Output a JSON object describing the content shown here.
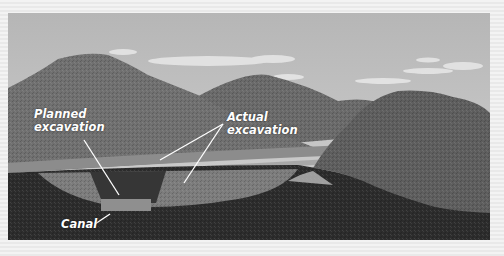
{
  "figure": {
    "type": "illustrated cross-section of mountain landscape with excavation",
    "labels": {
      "planned": [
        "Planned",
        "excavation"
      ],
      "actual": [
        "Actual",
        "excavation"
      ],
      "canal": "Canal"
    }
  },
  "colors": {
    "frame_light": "#f3f3f3",
    "frame_dark": "#e9e9e9",
    "sky_top": "#b9b9b9",
    "sky_bottom": "#d0d0d0",
    "mountain": "#6d6d6d",
    "ground_dark": "#2b2b2b",
    "actual_excavation": "#7a7a7a",
    "planned_excavation": "#3a3a3a",
    "canal": "#8e8e8e",
    "label_text": "#ffffff"
  }
}
